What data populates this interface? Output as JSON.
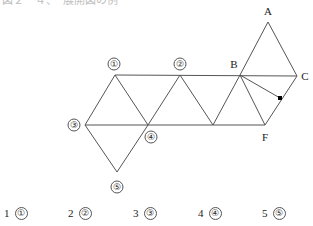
{
  "page": {
    "header_fragment": "図２－４、　展開図の例",
    "background_color": "#ffffff",
    "line_color": "#555555",
    "marker_color": "#000000"
  },
  "figure": {
    "name": "triangle-strip-net",
    "vertex_labels": [
      {
        "id": "A",
        "text": "A",
        "x": 268,
        "y": 11
      },
      {
        "id": "B",
        "text": "B",
        "x": 234,
        "y": 64
      },
      {
        "id": "C",
        "text": "C",
        "x": 305,
        "y": 76
      },
      {
        "id": "F",
        "text": "F",
        "x": 265,
        "y": 137
      }
    ],
    "circled_labels": [
      {
        "id": "c1",
        "text": "①",
        "x": 114,
        "y": 64
      },
      {
        "id": "c2",
        "text": "②",
        "x": 180,
        "y": 64
      },
      {
        "id": "c3",
        "text": "③",
        "x": 74,
        "y": 125
      },
      {
        "id": "c4",
        "text": "④",
        "x": 151,
        "y": 137
      },
      {
        "id": "c5",
        "text": "⑤",
        "x": 117,
        "y": 187
      }
    ],
    "points": {
      "A": {
        "x": 268,
        "y": 22
      },
      "B": {
        "x": 240,
        "y": 75
      },
      "C": {
        "x": 297,
        "y": 76
      },
      "F": {
        "x": 265,
        "y": 125
      },
      "P1": {
        "x": 115,
        "y": 75
      },
      "P2": {
        "x": 180,
        "y": 75
      },
      "P3": {
        "x": 85,
        "y": 125
      },
      "P4": {
        "x": 148,
        "y": 125
      },
      "P5": {
        "x": 117,
        "y": 172
      },
      "T1": {
        "x": 213,
        "y": 125
      },
      "M": {
        "x": 280,
        "y": 98
      }
    },
    "edges": [
      {
        "name": "top-rail",
        "from": "P1",
        "to": "C"
      },
      {
        "name": "bottom-rail",
        "from": "P3",
        "to": "F"
      },
      {
        "name": "edge-p1-p3",
        "from": "P1",
        "to": "P3"
      },
      {
        "name": "edge-p1-p4",
        "from": "P1",
        "to": "P4"
      },
      {
        "name": "edge-p2-p4",
        "from": "P2",
        "to": "P4"
      },
      {
        "name": "edge-p2-t1",
        "from": "P2",
        "to": "T1"
      },
      {
        "name": "edge-b-t1",
        "from": "B",
        "to": "T1"
      },
      {
        "name": "edge-b-f",
        "from": "B",
        "to": "F"
      },
      {
        "name": "edge-f-c",
        "from": "F",
        "to": "C"
      },
      {
        "name": "edge-b-a",
        "from": "B",
        "to": "A"
      },
      {
        "name": "edge-a-c",
        "from": "A",
        "to": "C"
      },
      {
        "name": "edge-b-marker",
        "from": "B",
        "to": "M"
      },
      {
        "name": "edge-p3-p5",
        "from": "P3",
        "to": "P5"
      },
      {
        "name": "edge-p5-p4",
        "from": "P5",
        "to": "P4"
      }
    ],
    "marker": {
      "name": "marked-point",
      "x": 280,
      "y": 98,
      "size": 4
    }
  },
  "legend": {
    "items": [
      {
        "number": "1",
        "symbol": "①",
        "x": 4
      },
      {
        "number": "2",
        "symbol": "②",
        "x": 68
      },
      {
        "number": "3",
        "symbol": "③",
        "x": 133
      },
      {
        "number": "4",
        "symbol": "④",
        "x": 198
      },
      {
        "number": "5",
        "symbol": "⑤",
        "x": 262
      }
    ]
  }
}
